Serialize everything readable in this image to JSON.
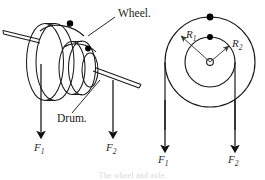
{
  "figure": {
    "caption": "The wheel and axle.",
    "stroke_color": "#1a1a1a",
    "fill_color": "#000000",
    "background": "#ffffff"
  },
  "left_diagram": {
    "name": "perspective-view",
    "labels": {
      "wheel": "Wheel.",
      "drum": "Drum."
    },
    "forces": [
      {
        "label": "F",
        "subscript": "1",
        "direction": "down"
      },
      {
        "label": "F",
        "subscript": "2",
        "direction": "down"
      }
    ],
    "parts": {
      "axle_left": "axle-shaft-left",
      "axle_right": "axle-shaft-right",
      "rope_point_wheel": "attachment-dot-wheel",
      "rope_point_drum": "attachment-dot-drum"
    }
  },
  "right_diagram": {
    "name": "schematic-view",
    "radii": [
      {
        "label": "R",
        "subscript": "1",
        "meaning": "wheel-radius"
      },
      {
        "label": "R",
        "subscript": "2",
        "meaning": "drum-radius"
      }
    ],
    "forces": [
      {
        "label": "F",
        "subscript": "1",
        "direction": "down"
      },
      {
        "label": "F",
        "subscript": "2",
        "direction": "down"
      }
    ],
    "parts": {
      "center": "axis-of-rotation",
      "outer_circle": "wheel-circle",
      "inner_circle": "drum-circle"
    }
  }
}
